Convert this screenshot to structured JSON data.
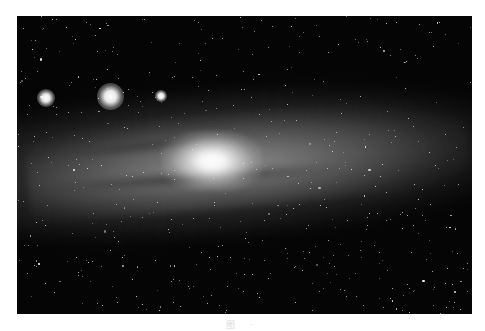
{
  "image": {
    "subject": "Andromeda galaxy (spiral galaxy) with satellite galaxies and star field",
    "tone": "grayscale",
    "colors": {
      "sky": "#050505",
      "core": "#ffffff",
      "page": "#ffffff"
    },
    "satellites": [
      {
        "x": 29,
        "y": 82,
        "r": 6
      },
      {
        "x": 93,
        "y": 80,
        "r": 9
      },
      {
        "x": 144,
        "y": 80,
        "r": 4
      }
    ]
  },
  "caption": {
    "text": "图 ·"
  }
}
